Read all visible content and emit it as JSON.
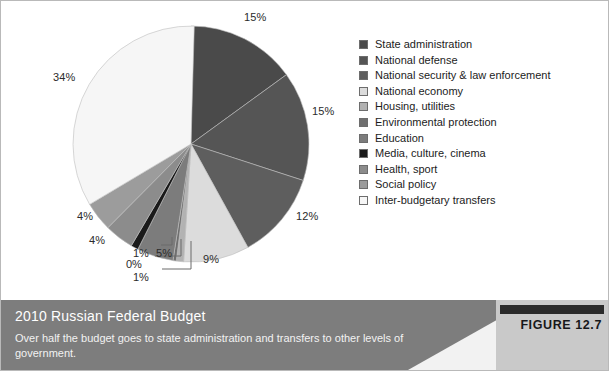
{
  "figure": {
    "label": "FIGURE 12.7",
    "title": "2010 Russian Federal Budget",
    "subtitle": "Over half the budget goes to state administration and transfers to other levels of government."
  },
  "chart_data": {
    "type": "pie",
    "title": "2010 Russian Federal Budget",
    "categories": [
      "State administration",
      "National defense",
      "National security & law enforcement",
      "National economy",
      "Housing, utilities",
      "Environmental protection",
      "Education",
      "Media, culture, cinema",
      "Health, sport",
      "Social policy",
      "Inter-budgetary transfers"
    ],
    "values": [
      15,
      15,
      12,
      9,
      1,
      0,
      5,
      1,
      4,
      4,
      34
    ],
    "value_labels": [
      "15%",
      "15%",
      "12%",
      "9%",
      "1%",
      "0%",
      "5%",
      "1%",
      "4%",
      "4%",
      "34%"
    ],
    "colors": [
      "#4a4a4a",
      "#555555",
      "#5e5e5e",
      "#dcdcdc",
      "#b2b2b2",
      "#6f6f6f",
      "#7c7c7c",
      "#1a1a1a",
      "#8c8c8c",
      "#9c9c9c",
      "#f6f6f6"
    ],
    "units": "percent",
    "start_angle": 0,
    "direction": "clockwise",
    "legend_position": "right",
    "grid": false,
    "xlabel": "",
    "ylabel": ""
  }
}
